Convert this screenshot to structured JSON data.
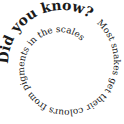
{
  "graphic": {
    "headline": "Did you know?",
    "fact": "Most snakes get their colours from pigments in the scales",
    "text_color": "#1a1a1a",
    "background": "#ffffff"
  }
}
